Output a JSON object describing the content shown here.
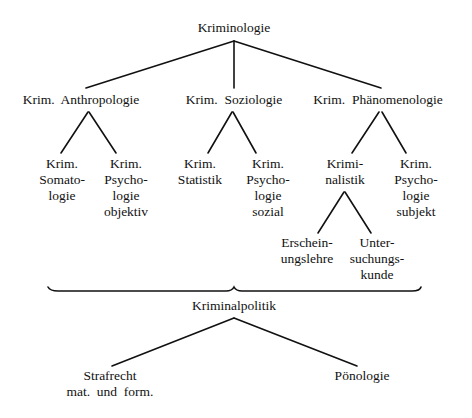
{
  "diagram": {
    "root": {
      "label": "Kriminologie"
    },
    "branches": [
      {
        "label": "Krim.  Anthropologie",
        "children": [
          {
            "lines": [
              "Krim.",
              "Somato-",
              "logie"
            ]
          },
          {
            "lines": [
              "Krim.",
              "Psycho-",
              "logie",
              "objektiv"
            ]
          }
        ]
      },
      {
        "label": "Krim.  Soziologie",
        "children": [
          {
            "lines": [
              "Krim.",
              "Statistik"
            ]
          },
          {
            "lines": [
              "Krim.",
              "Psycho-",
              "logie",
              "sozial"
            ]
          }
        ]
      },
      {
        "label": "Krim.  Phänomenologie",
        "children": [
          {
            "lines": [
              "Krimi-",
              "nalistik"
            ],
            "children": [
              {
                "lines": [
                  "Erschein-",
                  "ungslehre"
                ]
              },
              {
                "lines": [
                  "Unter-",
                  "suchungs-",
                  "kunde"
                ]
              }
            ]
          },
          {
            "lines": [
              "Krim.",
              "Psycho-",
              "logie",
              "subjekt"
            ]
          }
        ]
      }
    ],
    "summary": {
      "label": "Kriminalpolitik",
      "children": [
        {
          "lines": [
            "Strafrecht",
            "mat.  und  form."
          ]
        },
        {
          "lines": [
            "Pönologie"
          ]
        }
      ]
    }
  }
}
